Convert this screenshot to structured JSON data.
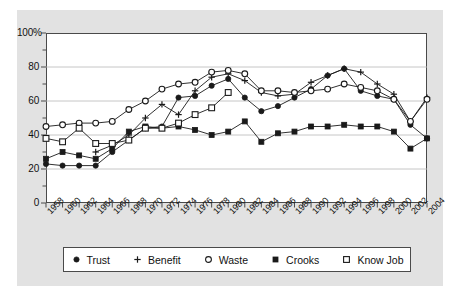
{
  "chart_data": {
    "type": "line",
    "title": "",
    "xlabel": "",
    "ylabel": "",
    "xlim": [
      1958,
      2004
    ],
    "ylim": [
      0,
      100
    ],
    "grid": true,
    "legend_position": "bottom",
    "x": [
      1958,
      1960,
      1962,
      1964,
      1966,
      1968,
      1970,
      1972,
      1974,
      1976,
      1978,
      1980,
      1982,
      1984,
      1986,
      1988,
      1990,
      1992,
      1994,
      1996,
      1998,
      2000,
      2002,
      2004
    ],
    "categories": [
      "1958",
      "1960",
      "1962",
      "1964",
      "1966",
      "1968",
      "1970",
      "1972",
      "1974",
      "1976",
      "1978",
      "1980",
      "1982",
      "1984",
      "1986",
      "1988",
      "1990",
      "1992",
      "1994",
      "1996",
      "1998",
      "2000",
      "2002",
      "2004"
    ],
    "yticks": [
      0,
      20,
      40,
      60,
      80,
      100
    ],
    "ytick_labels": [
      "0",
      "20",
      "40",
      "60",
      "80",
      "100%"
    ],
    "series": [
      {
        "name": "Trust",
        "marker": "filled-circle",
        "values": [
          23,
          22,
          22,
          22,
          30,
          37,
          44,
          45,
          62,
          63,
          69,
          73,
          62,
          54,
          57,
          62,
          67,
          75,
          79,
          66,
          63,
          61,
          46,
          38
        ]
      },
      {
        "name": "Benefit",
        "marker": "plus",
        "values": [
          null,
          null,
          null,
          30,
          34,
          40,
          50,
          58,
          52,
          66,
          74,
          76,
          72,
          65,
          63,
          64,
          71,
          75,
          79,
          77,
          70,
          64,
          48,
          62
        ]
      },
      {
        "name": "Waste",
        "marker": "open-circle",
        "values": [
          45,
          46,
          47,
          47,
          48,
          55,
          60,
          67,
          70,
          71,
          77,
          78,
          76,
          66,
          66,
          65,
          66,
          67,
          70,
          68,
          66,
          61,
          48,
          61
        ]
      },
      {
        "name": "Crooks",
        "marker": "filled-square",
        "values": [
          26,
          30,
          28,
          26,
          32,
          42,
          45,
          44,
          45,
          43,
          40,
          42,
          48,
          36,
          41,
          42,
          45,
          45,
          46,
          45,
          45,
          42,
          32,
          38
        ]
      },
      {
        "name": "Know Job",
        "marker": "open-square",
        "values": [
          38,
          36,
          44,
          35,
          35,
          37,
          44,
          44,
          47,
          52,
          56,
          65,
          null,
          null,
          null,
          null,
          null,
          null,
          null,
          null,
          null,
          null,
          null,
          null
        ]
      }
    ],
    "legend": [
      {
        "label": "Trust",
        "marker": "filled-circle"
      },
      {
        "label": "Benefit",
        "marker": "plus"
      },
      {
        "label": "Waste",
        "marker": "open-circle"
      },
      {
        "label": "Crooks",
        "marker": "filled-square"
      },
      {
        "label": "Know Job",
        "marker": "open-square"
      }
    ],
    "colors": {
      "line": "#1a1a1a",
      "grid": "#b8b8b8",
      "axis": "#4a4a4a",
      "figure_background": "#e2e2e2",
      "plot_background": "#ffffff"
    }
  }
}
